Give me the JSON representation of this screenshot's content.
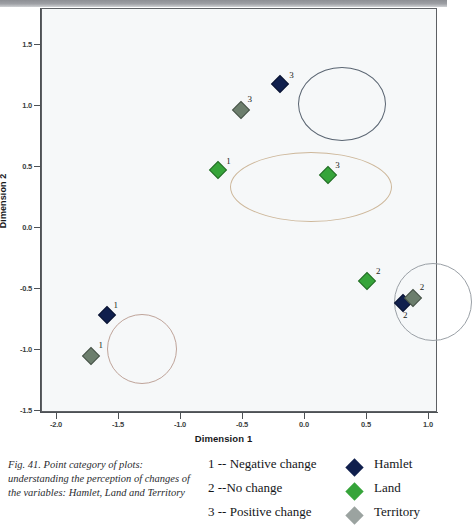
{
  "figure": {
    "caption": "Fig. 41. Point category of plots: understanding the perception of changes of the variables: Hamlet, Land and Territory"
  },
  "chart_data": {
    "type": "scatter",
    "title": "",
    "xlabel": "Dimension 1",
    "ylabel": "Dimension 2",
    "xlim": [
      -2.25,
      1.2
    ],
    "ylim": [
      -1.5,
      1.8
    ],
    "xticks": [
      "-2.0",
      "-1.5",
      "-1.0",
      "-0.5",
      "0.0",
      "0.5",
      "1.0"
    ],
    "xtick_values": [
      -2.0,
      -1.5,
      -1.0,
      -0.5,
      0.0,
      0.5,
      1.0
    ],
    "yticks": [
      "1.5",
      "1.0",
      "0.5",
      "0.0",
      "-0.5",
      "-1.0",
      "-1.5"
    ],
    "ytick_values": [
      1.5,
      1.0,
      0.5,
      0.0,
      -0.5,
      -1.0,
      -1.5
    ],
    "grid": false,
    "legend_position": "below-right",
    "series": [
      {
        "name": "Hamlet",
        "color": "#101f4d",
        "points": [
          {
            "x": -0.19,
            "y": 1.17,
            "label": "3",
            "label_dx": 11,
            "label_dy": -9
          },
          {
            "x": 0.8,
            "y": -0.62,
            "label": "2",
            "label_dx": 2,
            "label_dy": 12
          },
          {
            "x": -1.59,
            "y": -0.72,
            "label": "1",
            "label_dx": 9,
            "label_dy": -10
          }
        ]
      },
      {
        "name": "Land",
        "color": "#36a43a",
        "points": [
          {
            "x": -0.69,
            "y": 0.47,
            "label": "1",
            "label_dx": 10,
            "label_dy": -9
          },
          {
            "x": 0.19,
            "y": 0.43,
            "label": "3",
            "label_dx": 10,
            "label_dy": -10
          },
          {
            "x": 0.51,
            "y": -0.44,
            "label": "2",
            "label_dx": 11,
            "label_dy": -10
          }
        ]
      },
      {
        "name": "Territory",
        "color": "#6c7e6d",
        "points": [
          {
            "x": -0.51,
            "y": 0.96,
            "label": "3",
            "label_dx": 9,
            "label_dy": -11
          },
          {
            "x": 0.88,
            "y": -0.58,
            "label": "2",
            "label_dx": 9,
            "label_dy": -11
          },
          {
            "x": -1.72,
            "y": -1.06,
            "label": "1",
            "label_dx": 10,
            "label_dy": -11
          }
        ]
      }
    ],
    "clusters": [
      {
        "name": "positive-change-cluster",
        "cx": 300,
        "cy": 95,
        "rx": 44,
        "ry": 37,
        "color": "#5a6572"
      },
      {
        "name": "negative-change-cluster",
        "cx": 269,
        "cy": 178,
        "rx": 81,
        "ry": 35,
        "color": "#cdb79a"
      },
      {
        "name": "no-change-cluster",
        "cx": 391,
        "cy": 293,
        "rx": 39,
        "ry": 39,
        "color": "#9aa0a6"
      },
      {
        "name": "hamlet-negative-cluster",
        "cx": 100,
        "cy": 340,
        "rx": 35,
        "ry": 35,
        "color": "#bfa49a"
      }
    ]
  },
  "legend": {
    "categories": [
      {
        "code": "1 -- Negative change"
      },
      {
        "code": "2 --No change"
      },
      {
        "code": "3 -- Positive change"
      }
    ],
    "variables": [
      {
        "name": "Hamlet",
        "color": "#101f4d"
      },
      {
        "name": "Land",
        "color": "#36a43a"
      },
      {
        "name": "Territory",
        "color": "#9ba3a0"
      }
    ]
  }
}
